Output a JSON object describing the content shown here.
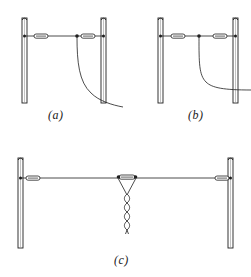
{
  "figure": {
    "background_color": "#ffffff",
    "line_color": "#1f1f1f",
    "width": 251,
    "height": 277
  },
  "panels": [
    {
      "id": "a",
      "caption": "(a)",
      "description": "Wire antenna strung between two masts, end insulators at both ends, feed line dropping from a point near the right mast and curving away behind the mast",
      "masts": [
        {
          "name": "left-mast",
          "x": 22,
          "top": 18,
          "bottom": 103,
          "width": 5
        },
        {
          "name": "right-mast",
          "x": 101,
          "top": 18,
          "bottom": 103,
          "width": 5
        }
      ],
      "wire": {
        "y": 36,
        "x_start": 24,
        "x_end": 103
      },
      "insulators": [
        {
          "name": "left-insulator",
          "cx": 41,
          "cy": 36,
          "length": 14,
          "height": 4
        },
        {
          "name": "right-insulator",
          "cx": 88,
          "cy": 36,
          "length": 14,
          "height": 4
        }
      ],
      "terminal_dots": [
        {
          "name": "left-terminal-dot",
          "cx": 24,
          "cy": 36
        },
        {
          "name": "right-terminal-dot",
          "cx": 102,
          "cy": 36
        },
        {
          "name": "feed-point-dot",
          "cx": 77,
          "cy": 36
        }
      ],
      "feed_line": {
        "name": "feed-line-a",
        "path": "M77,37 C77,60 79,80 91,92 C99,100 112,104 123,106"
      }
    },
    {
      "id": "b",
      "caption": "(b)",
      "description": "Same span with the feed line taken off farther from the mast, dropping vertically then bending horizontally out past the right mast",
      "masts": [
        {
          "name": "left-mast",
          "x": 158,
          "top": 18,
          "bottom": 103,
          "width": 5
        },
        {
          "name": "right-mast",
          "x": 233,
          "top": 18,
          "bottom": 103,
          "width": 5
        }
      ],
      "wire": {
        "y": 36,
        "x_start": 160,
        "x_end": 235
      },
      "insulators": [
        {
          "name": "left-insulator",
          "cx": 178,
          "cy": 36,
          "length": 14,
          "height": 4
        },
        {
          "name": "right-insulator",
          "cx": 220,
          "cy": 36,
          "length": 14,
          "height": 4
        }
      ],
      "terminal_dots": [
        {
          "name": "left-terminal-dot",
          "cx": 160,
          "cy": 36
        },
        {
          "name": "right-terminal-dot",
          "cx": 234,
          "cy": 36
        },
        {
          "name": "feed-point-dot",
          "cx": 199,
          "cy": 36
        }
      ],
      "feed_line": {
        "name": "feed-line-b",
        "path": "M199,37 C199,62 199,74 206,81 C212,87 224,89 251,89"
      }
    },
    {
      "id": "c",
      "caption": "(c)",
      "description": "Centre-fed dipole between two masts with end insulators, a centre insulator, and a twisted-pair transmission line dropping from the centre",
      "masts": [
        {
          "name": "left-mast",
          "x": 18,
          "top": 158,
          "bottom": 248,
          "width": 5
        },
        {
          "name": "right-mast",
          "x": 228,
          "top": 158,
          "bottom": 248,
          "width": 5
        }
      ],
      "wire": {
        "y": 178,
        "x_start": 20,
        "x_end": 230
      },
      "insulators": [
        {
          "name": "left-insulator",
          "cx": 33,
          "cy": 178,
          "length": 14,
          "height": 4
        },
        {
          "name": "centre-insulator",
          "cx": 127,
          "cy": 177,
          "length": 16,
          "height": 4
        },
        {
          "name": "right-insulator",
          "cx": 222,
          "cy": 178,
          "length": 14,
          "height": 4
        }
      ],
      "terminal_dots": [
        {
          "name": "left-terminal-dot",
          "cx": 20,
          "cy": 178
        },
        {
          "name": "right-terminal-dot",
          "cx": 231,
          "cy": 178
        },
        {
          "name": "centre-left-dot",
          "cx": 119,
          "cy": 177
        },
        {
          "name": "centre-right-dot",
          "cx": 135,
          "cy": 177
        }
      ],
      "feed_line": {
        "name": "twisted-feeder-c",
        "left_leg": "M119,178 L127,193",
        "right_leg": "M135,178 L127,193",
        "twist_top_y": 193,
        "twist_bottom_y": 232,
        "twist_x": 127,
        "twist_amplitude": 3.5,
        "twist_periods": 11
      }
    }
  ]
}
